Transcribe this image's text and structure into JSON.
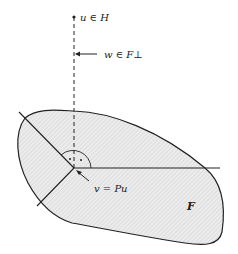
{
  "diagram": {
    "labels": {
      "u": "u ∈ H",
      "w": "w ∈ F⊥",
      "v": "v = Pu",
      "F": "F"
    },
    "colors": {
      "stroke": "#222222",
      "fill": "#e4e4e4",
      "background": "#ffffff"
    }
  }
}
